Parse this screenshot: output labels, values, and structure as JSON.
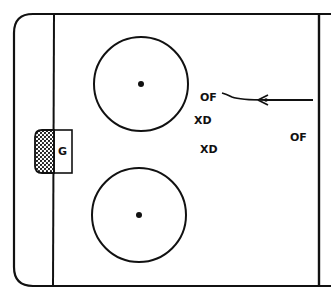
{
  "diagram": {
    "type": "hockey-rink-half-zone",
    "colors": {
      "line": "#111111",
      "background": "#ffffff"
    },
    "goal": {
      "label": "G"
    },
    "players": [
      {
        "id": "of-top",
        "label": "OF",
        "role": "offensive forward"
      },
      {
        "id": "xd-1",
        "label": "XD",
        "role": "defender"
      },
      {
        "id": "xd-2",
        "label": "XD",
        "role": "defender"
      },
      {
        "id": "of-right",
        "label": "OF",
        "role": "offensive forward"
      }
    ],
    "faceoff_circles": [
      {
        "id": "top",
        "has_dot": true
      },
      {
        "id": "bottom",
        "has_dot": true
      }
    ],
    "pass_arrow": {
      "from": "right boards",
      "to": "OF",
      "style": "curved line with arrowhead"
    }
  }
}
